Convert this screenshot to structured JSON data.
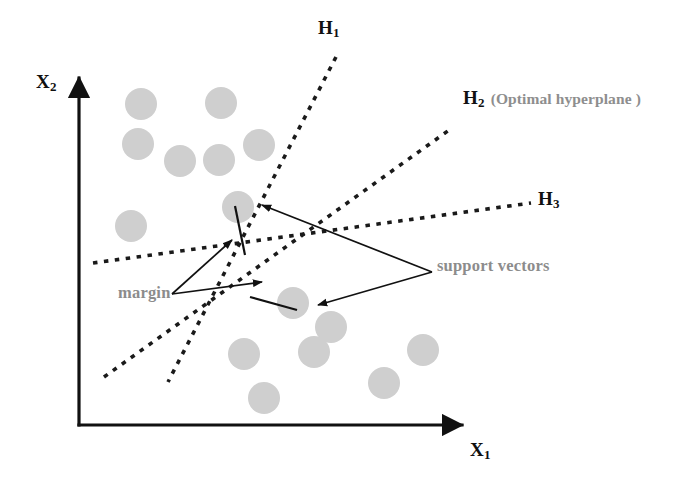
{
  "figure": {
    "background_color": "#ffffff",
    "width": 694,
    "height": 480
  },
  "axes": {
    "x_label": "X",
    "x_subscript": "1",
    "y_label": "X",
    "y_subscript": "2",
    "color": "#111111",
    "origin": {
      "x": 79,
      "y": 425
    },
    "x_end": {
      "x": 462,
      "y": 425
    },
    "y_end": {
      "x": 79,
      "y": 78
    }
  },
  "hyperplanes": [
    {
      "id": "H1",
      "label": "H",
      "subscript": "1",
      "note": "",
      "style": "dashed",
      "color": "#1a1a1a",
      "x1": 336,
      "y1": 57,
      "x2": 168,
      "y2": 382
    },
    {
      "id": "H2",
      "label": "H",
      "subscript": "2",
      "note": "(Optimal hyperplane )",
      "style": "dashed",
      "color": "#1a1a1a",
      "x1": 104,
      "y1": 377,
      "x2": 452,
      "y2": 128
    },
    {
      "id": "H3",
      "label": "H",
      "subscript": "3",
      "note": "",
      "style": "dashed",
      "color": "#1a1a1a",
      "x1": 93,
      "y1": 263,
      "x2": 531,
      "y2": 203
    }
  ],
  "annotations": {
    "margin": "margin",
    "support_vectors": "support vectors",
    "color": "#8c8c8c"
  },
  "data_points": {
    "fill": "#cfcfcf",
    "radius": 16,
    "class_a_name": "upper-left cluster",
    "class_b_name": "lower-right cluster",
    "class_a": [
      {
        "x": 141,
        "y": 104
      },
      {
        "x": 221,
        "y": 103
      },
      {
        "x": 138,
        "y": 144
      },
      {
        "x": 180,
        "y": 161
      },
      {
        "x": 219,
        "y": 160
      },
      {
        "x": 259,
        "y": 145
      },
      {
        "x": 131,
        "y": 226
      },
      {
        "x": 238,
        "y": 207
      }
    ],
    "class_b": [
      {
        "x": 293,
        "y": 303
      },
      {
        "x": 331,
        "y": 327
      },
      {
        "x": 244,
        "y": 354
      },
      {
        "x": 314,
        "y": 352
      },
      {
        "x": 264,
        "y": 398
      },
      {
        "x": 384,
        "y": 383
      },
      {
        "x": 423,
        "y": 350
      }
    ],
    "support_vectors": [
      {
        "x": 238,
        "y": 207,
        "label": "upper support vector"
      },
      {
        "x": 293,
        "y": 303,
        "label": "lower support vector"
      }
    ]
  },
  "margin_segments": [
    {
      "x1": 235,
      "y1": 206,
      "x2": 245,
      "y2": 255
    },
    {
      "x1": 250,
      "y1": 297,
      "x2": 297,
      "y2": 310
    }
  ],
  "leader_lines": {
    "color": "#111111",
    "margin_arrows": [
      {
        "x1": 172,
        "y1": 294,
        "x2": 232,
        "y2": 240,
        "arrow": "end"
      },
      {
        "x1": 172,
        "y1": 294,
        "x2": 262,
        "y2": 282,
        "arrow": "end"
      }
    ],
    "support_arrows": [
      {
        "x1": 432,
        "y1": 272,
        "x2": 262,
        "y2": 205,
        "arrow": "end"
      },
      {
        "x1": 432,
        "y1": 272,
        "x2": 318,
        "y2": 305,
        "arrow": "end"
      }
    ]
  }
}
